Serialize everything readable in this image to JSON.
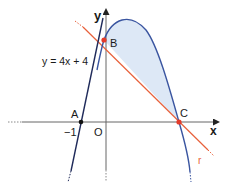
{
  "diagram": {
    "type": "function-graph",
    "axes": {
      "x_label": "x",
      "y_label": "y",
      "origin_label": "O"
    },
    "points": [
      {
        "name": "A",
        "x": -1,
        "y": 0
      },
      {
        "name": "B",
        "x": 0,
        "y": 4
      },
      {
        "name": "C",
        "x": 3,
        "y": 0
      }
    ],
    "tick_labels": {
      "x_minus_one": "−1"
    },
    "tangent_line": {
      "equation_label": "y = 4x + 4"
    },
    "secant_line": {
      "label": "r"
    },
    "shaded_region": "area between parabola and line r from B to C"
  },
  "colors": {
    "axis": "#555555",
    "tangent": "#1f2a5a",
    "parabola": "#3a55a0",
    "line_r": "#e8603a",
    "fill": "#dde8f6",
    "point": "#e53b2a"
  }
}
